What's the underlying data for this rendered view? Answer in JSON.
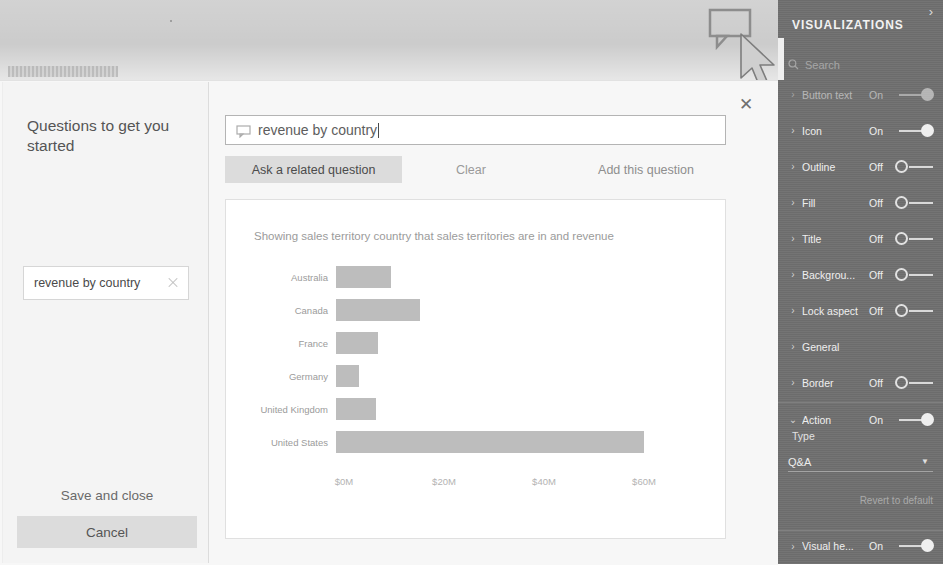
{
  "banner": {
    "ghost_label": ""
  },
  "qna_visual": {
    "icon": "speech-bubble-icon",
    "cursor": "mouse-pointer-icon"
  },
  "dialog": {
    "close_label": "✕",
    "suggestions": {
      "heading": "Questions to get you started",
      "chips": [
        {
          "label": "revenue by country",
          "remove_icon": "close-x-icon"
        }
      ],
      "save_and_close_label": "Save and close",
      "cancel_label": "Cancel"
    },
    "question": {
      "icon": "speech-bubble-icon",
      "value": "revenue by country",
      "placeholder": "Ask a question about your data"
    },
    "actions": {
      "ask_related_label": "Ask a related question",
      "clear_label": "Clear",
      "add_question_label": "Add this question"
    },
    "result": {
      "subtitle": "Showing sales territory country that sales territories are in and revenue"
    }
  },
  "chart_data": {
    "type": "bar",
    "orientation": "horizontal",
    "title": "",
    "subtitle": "Showing sales territory country that sales territories are in and revenue",
    "categories": [
      "Australia",
      "Canada",
      "France",
      "Germany",
      "United Kingdom",
      "United States"
    ],
    "values": [
      11.0,
      16.7,
      8.4,
      4.6,
      8.0,
      61.6
    ],
    "xlabel": "",
    "ylabel": "",
    "xlim": [
      0,
      66
    ],
    "tick_values": [
      0,
      20,
      40,
      60
    ],
    "tick_labels": [
      "$0M",
      "$20M",
      "$40M",
      "$60M"
    ],
    "grid": false,
    "legend": false,
    "series_color": "#bdbdbd"
  },
  "visualizations_panel": {
    "title": "VISUALIZATIONS",
    "collapse_icon": "chevron-right-icon",
    "search": {
      "icon": "search-icon",
      "placeholder": "Search"
    },
    "rows": [
      {
        "label": "Button text",
        "state": "On",
        "toggle": "on",
        "chevron": "chevron-right-icon",
        "partial": true
      },
      {
        "label": "Icon",
        "state": "On",
        "toggle": "on",
        "chevron": "chevron-right-icon"
      },
      {
        "label": "Outline",
        "state": "Off",
        "toggle": "off",
        "chevron": "chevron-right-icon"
      },
      {
        "label": "Fill",
        "state": "Off",
        "toggle": "off",
        "chevron": "chevron-right-icon"
      },
      {
        "label": "Title",
        "state": "Off",
        "toggle": "off",
        "chevron": "chevron-right-icon"
      },
      {
        "label": "Backgrou...",
        "state": "Off",
        "toggle": "off",
        "chevron": "chevron-right-icon"
      },
      {
        "label": "Lock aspect",
        "state": "Off",
        "toggle": "off",
        "chevron": "chevron-right-icon"
      },
      {
        "label": "General",
        "state": "",
        "toggle": "none",
        "chevron": "chevron-right-icon"
      },
      {
        "label": "Border",
        "state": "Off",
        "toggle": "off",
        "chevron": "chevron-right-icon"
      },
      {
        "label": "Action",
        "state": "On",
        "toggle": "on",
        "chevron": "chevron-down-icon",
        "expanded": true
      }
    ],
    "action_section": {
      "type_label": "Type",
      "type_value": "Q&A",
      "type_caret": "chevron-down-icon",
      "revert_label": "Revert to default"
    },
    "bottom_row": {
      "label": "Visual he...",
      "state": "On",
      "toggle": "on",
      "chevron": "chevron-right-icon"
    },
    "colors": {
      "panel_bg": "#6f6f6f",
      "text": "#efefef"
    }
  }
}
